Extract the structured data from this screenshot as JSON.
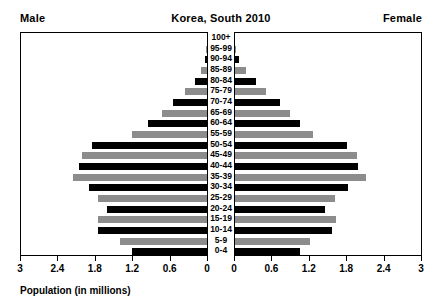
{
  "header": {
    "male_label": "Male",
    "female_label": "Female",
    "title": "Korea, South 2010"
  },
  "axis_caption": "Population (in millions)",
  "chart_data": {
    "type": "bar",
    "subtype": "population-pyramid",
    "title": "Korea, South 2010",
    "xlabel": "Population (in millions)",
    "ylabel": "",
    "xlim": [
      0,
      3
    ],
    "grid": false,
    "legend": "none",
    "left_side": "Male",
    "right_side": "Female",
    "tick_values": [
      3,
      2.4,
      1.8,
      1.2,
      0.6,
      0
    ],
    "tick_labels_left": [
      "3",
      "2.4",
      "1.8",
      "1.2",
      "0.6",
      "0"
    ],
    "tick_labels_right": [
      "0",
      "0.6",
      "1.2",
      "1.8",
      "2.4",
      "3"
    ],
    "categories": [
      "100+",
      "95-99",
      "90-94",
      "85-89",
      "80-84",
      "75-79",
      "70-74",
      "65-69",
      "60-64",
      "55-59",
      "50-54",
      "45-49",
      "40-44",
      "35-39",
      "30-34",
      "25-29",
      "20-24",
      "15-19",
      "10-14",
      "5-9",
      "0-4"
    ],
    "bar_colors": [
      "dark",
      "light",
      "dark",
      "light",
      "dark",
      "light",
      "dark",
      "light",
      "dark",
      "light",
      "dark",
      "light",
      "dark",
      "light",
      "dark",
      "light",
      "dark",
      "light",
      "dark",
      "light",
      "dark"
    ],
    "series": [
      {
        "name": "Male",
        "values": [
          0.0,
          0.01,
          0.03,
          0.09,
          0.2,
          0.35,
          0.55,
          0.72,
          0.95,
          1.2,
          1.85,
          2.0,
          2.05,
          2.15,
          1.9,
          1.75,
          1.6,
          1.75,
          1.75,
          1.4,
          1.2
        ]
      },
      {
        "name": "Female",
        "values": [
          0.0,
          0.02,
          0.07,
          0.17,
          0.33,
          0.5,
          0.72,
          0.88,
          1.05,
          1.25,
          1.8,
          1.95,
          1.98,
          2.1,
          1.82,
          1.6,
          1.45,
          1.62,
          1.55,
          1.2,
          1.05
        ]
      }
    ]
  }
}
